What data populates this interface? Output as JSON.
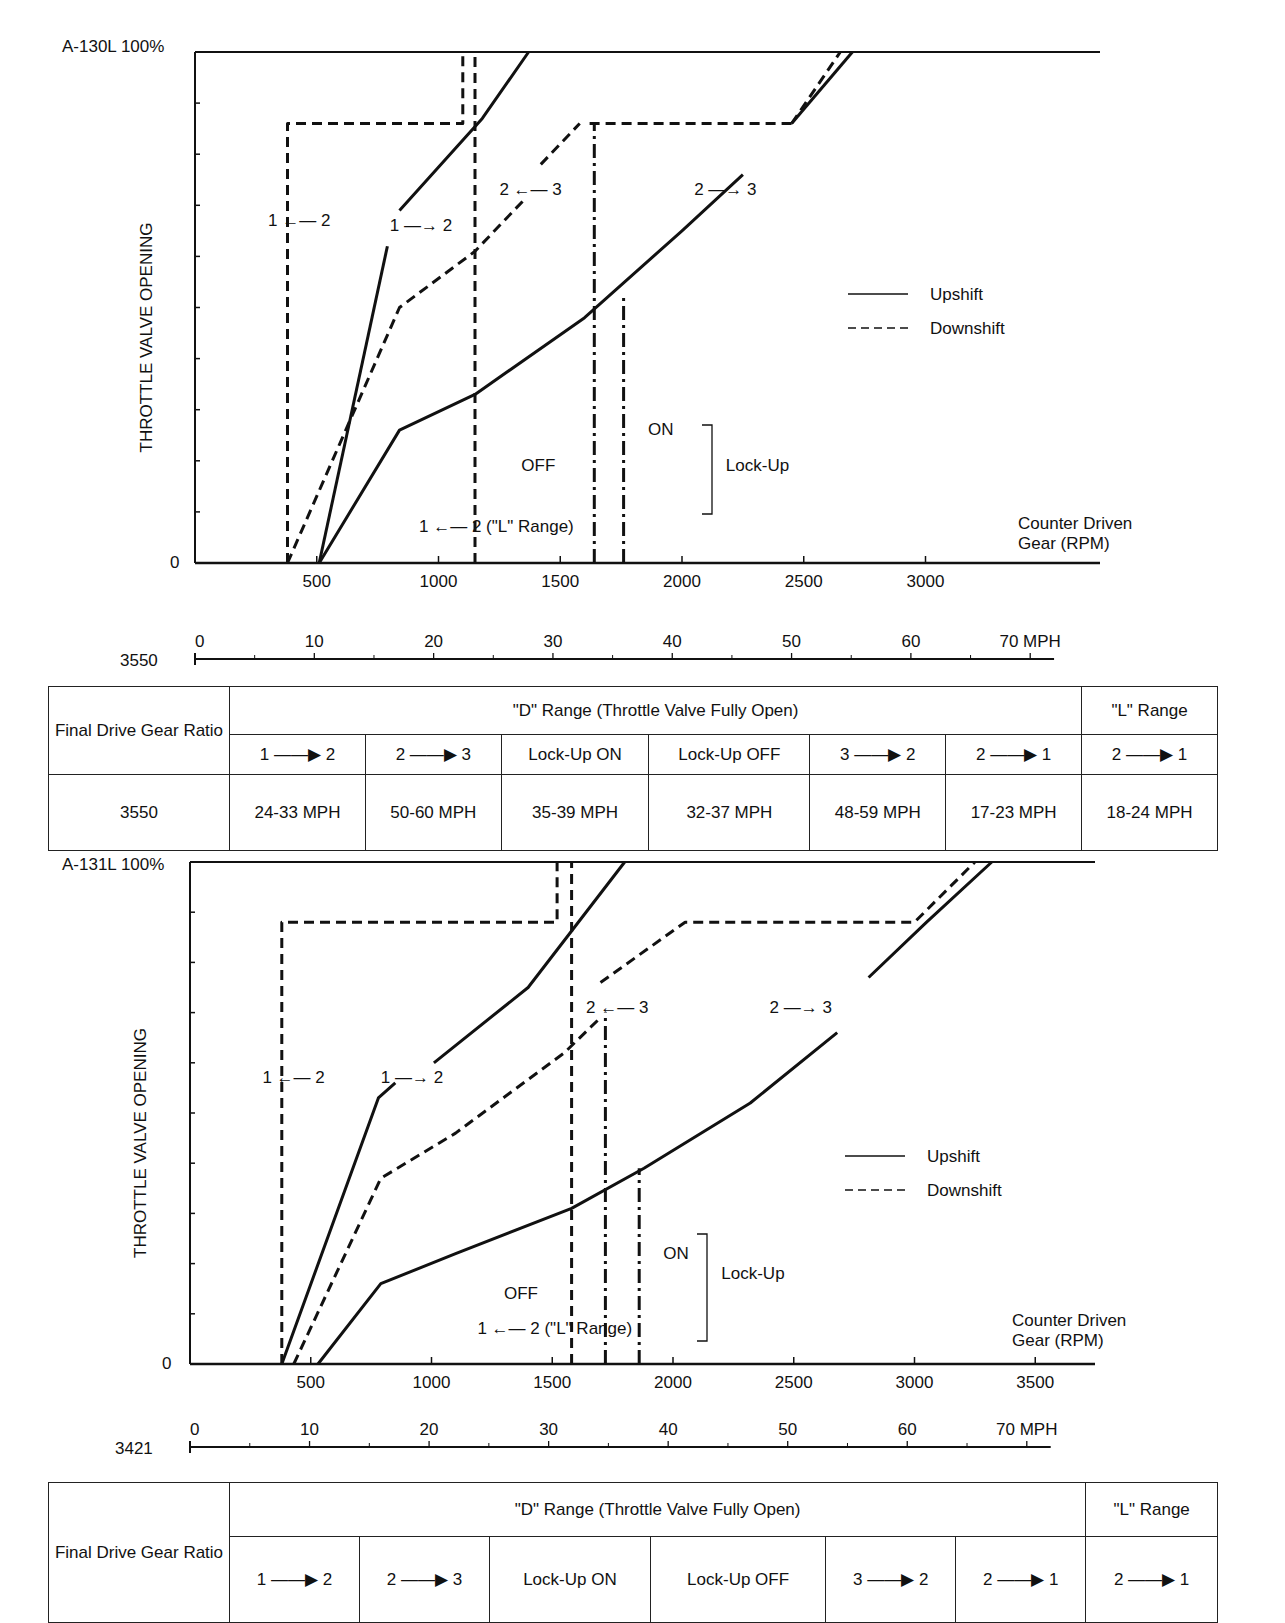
{
  "chart_data": [
    {
      "type": "line",
      "id": "a130l",
      "title": "A-130L 100%",
      "top_label": "A-130L 100%",
      "ylabel": "THROTTLE VALVE OPENING",
      "xlabel": [
        "Counter Driven",
        "Gear (RPM)"
      ],
      "y_zero_label": "0",
      "xlim": [
        0,
        3700
      ],
      "ylim": [
        0,
        100
      ],
      "x_ticks": [
        500,
        1000,
        1500,
        2000,
        2500,
        3000
      ],
      "x_tick_labels": [
        "500",
        "1000",
        "1500",
        "2000",
        "2500",
        "3000"
      ],
      "y_ticks": [
        10,
        20,
        30,
        40,
        50,
        60,
        70,
        80,
        90
      ],
      "legend": {
        "position": "right",
        "entries": [
          {
            "label": "Upshift",
            "style": "solid"
          },
          {
            "label": "Downshift",
            "style": "dashed"
          }
        ]
      },
      "series": [
        {
          "name": "1→2 upshift",
          "style": "solid",
          "points": [
            [
              510,
              0
            ],
            [
              790,
              62
            ]
          ]
        },
        {
          "name": "1→2 upshift (upper)",
          "style": "solid",
          "points": [
            [
              840,
              69
            ],
            [
              1180,
              87
            ],
            [
              1370,
              100
            ]
          ]
        },
        {
          "name": "1→2 downshift",
          "style": "dashed",
          "points": [
            [
              380,
              0
            ],
            [
              840,
              50
            ],
            [
              1150,
              61
            ],
            [
              1350,
              71
            ]
          ]
        },
        {
          "name": "1→2 downshift (upper)",
          "style": "dashed",
          "points": [
            [
              1420,
              78
            ],
            [
              1580,
              86
            ]
          ]
        },
        {
          "name": "1←2 downshift boundary",
          "style": "dashed",
          "points": [
            [
              380,
              0
            ],
            [
              380,
              86
            ],
            [
              1100,
              86
            ],
            [
              1100,
              100
            ]
          ]
        },
        {
          "name": "1←2 L range",
          "style": "dashed",
          "points": [
            [
              1150,
              0
            ],
            [
              1150,
              100
            ]
          ]
        },
        {
          "name": "2→3 upshift",
          "style": "solid",
          "points": [
            [
              510,
              0
            ],
            [
              840,
              26
            ],
            [
              1150,
              33
            ],
            [
              1600,
              48
            ],
            [
              2000,
              65
            ],
            [
              2250,
              76
            ]
          ]
        },
        {
          "name": "2→3 upshift (upper)",
          "style": "solid",
          "points": [
            [
              2450,
              86
            ],
            [
              2700,
              100
            ]
          ]
        },
        {
          "name": "2←3 downshift",
          "style": "dashed",
          "points": [
            [
              2450,
              86
            ],
            [
              1600,
              86
            ]
          ]
        },
        {
          "name": "2←3 downshift (upper)",
          "style": "dashed",
          "points": [
            [
              2450,
              86
            ],
            [
              2650,
              100
            ]
          ]
        },
        {
          "name": "Lock-up OFF",
          "style": "dashdot",
          "points": [
            [
              1640,
              0
            ],
            [
              1640,
              86
            ]
          ]
        },
        {
          "name": "Lock-up ON",
          "style": "dashdot",
          "points": [
            [
              1760,
              0
            ],
            [
              1760,
              52
            ]
          ]
        }
      ],
      "annotations": [
        {
          "text": "1 ←— 2",
          "rpm": 300,
          "pct": 66
        },
        {
          "text": "1 —→ 2",
          "rpm": 800,
          "pct": 65
        },
        {
          "text": "2 ←— 3",
          "rpm": 1250,
          "pct": 72
        },
        {
          "text": "2 —→ 3",
          "rpm": 2050,
          "pct": 72
        },
        {
          "text": "ON",
          "rpm": 1860,
          "pct": 25
        },
        {
          "text": "OFF",
          "rpm": 1340,
          "pct": 18
        },
        {
          "text": "Lock-Up",
          "rpm": 2180,
          "pct": 18
        },
        {
          "text": "1 ←— 2 (\"L\" Range)",
          "rpm": 920,
          "pct": 6
        }
      ],
      "mph_scale": {
        "ratio_label": "3550",
        "ticks": [
          0,
          10,
          20,
          30,
          40,
          50,
          60,
          70
        ],
        "tick_labels": [
          "0",
          "10",
          "20",
          "30",
          "40",
          "50",
          "60",
          "70 MPH"
        ],
        "rpm_per_mph": 49.0
      }
    },
    {
      "type": "line",
      "id": "a131l",
      "title": "A-131L 100%",
      "top_label": "A-131L 100%",
      "ylabel": "THROTTLE VALVE OPENING",
      "xlabel": [
        "Counter Driven",
        "Gear (RPM)"
      ],
      "y_zero_label": "0",
      "xlim": [
        0,
        3800
      ],
      "ylim": [
        0,
        100
      ],
      "x_ticks": [
        500,
        1000,
        1500,
        2000,
        2500,
        3000,
        3500
      ],
      "x_tick_labels": [
        "500",
        "1000",
        "1500",
        "2000",
        "2500",
        "3000",
        "3500"
      ],
      "y_ticks": [
        10,
        20,
        30,
        40,
        50,
        60,
        70,
        80,
        90
      ],
      "legend": {
        "position": "right",
        "entries": [
          {
            "label": "Upshift",
            "style": "solid"
          },
          {
            "label": "Downshift",
            "style": "dashed"
          }
        ]
      },
      "series": [
        {
          "name": "1→2 upshift",
          "style": "solid",
          "points": [
            [
              380,
              0
            ],
            [
              780,
              53
            ],
            [
              850,
              56
            ]
          ]
        },
        {
          "name": "1→2 upshift (upper)",
          "style": "solid",
          "points": [
            [
              1010,
              60
            ],
            [
              1400,
              75
            ],
            [
              1800,
              100
            ]
          ]
        },
        {
          "name": "1→2 downshift",
          "style": "dashed",
          "points": [
            [
              430,
              0
            ],
            [
              790,
              37
            ],
            [
              1100,
              46
            ],
            [
              1550,
              62
            ],
            [
              1700,
              69
            ]
          ]
        },
        {
          "name": "2←3 downshift (upper)",
          "style": "dashed",
          "points": [
            [
              1700,
              76
            ],
            [
              2050,
              88
            ],
            [
              3000,
              88
            ],
            [
              3250,
              100
            ]
          ]
        },
        {
          "name": "1←2 downshift boundary",
          "style": "dashed",
          "points": [
            [
              380,
              0
            ],
            [
              380,
              88
            ],
            [
              1520,
              88
            ],
            [
              1520,
              100
            ]
          ]
        },
        {
          "name": "1←2 L range",
          "style": "dashed",
          "points": [
            [
              1580,
              0
            ],
            [
              1580,
              100
            ]
          ]
        },
        {
          "name": "2→3 upshift",
          "style": "solid",
          "points": [
            [
              530,
              0
            ],
            [
              790,
              16
            ],
            [
              1100,
              22
            ],
            [
              1580,
              31
            ],
            [
              1880,
              39
            ],
            [
              2320,
              52
            ],
            [
              2680,
              66
            ]
          ]
        },
        {
          "name": "2→3 upshift (upper)",
          "style": "solid",
          "points": [
            [
              2810,
              77
            ],
            [
              3050,
              88
            ],
            [
              3320,
              100
            ]
          ]
        },
        {
          "name": "Lock-up OFF",
          "style": "dashdot",
          "points": [
            [
              1720,
              0
            ],
            [
              1720,
              70
            ]
          ]
        },
        {
          "name": "Lock-up ON",
          "style": "dashdot",
          "points": [
            [
              1860,
              0
            ],
            [
              1860,
              39
            ]
          ]
        }
      ],
      "annotations": [
        {
          "text": "1 ←— 2",
          "rpm": 300,
          "pct": 56
        },
        {
          "text": "1 —→ 2",
          "rpm": 790,
          "pct": 56
        },
        {
          "text": "2 ←— 3",
          "rpm": 1640,
          "pct": 70
        },
        {
          "text": "2 —→ 3",
          "rpm": 2400,
          "pct": 70
        },
        {
          "text": "ON",
          "rpm": 1960,
          "pct": 21
        },
        {
          "text": "OFF",
          "rpm": 1300,
          "pct": 13
        },
        {
          "text": "Lock-Up",
          "rpm": 2200,
          "pct": 17
        },
        {
          "text": "1 ←— 2 (\"L\" Range)",
          "rpm": 1190,
          "pct": 6
        }
      ],
      "mph_scale": {
        "ratio_label": "3421",
        "ticks": [
          0,
          10,
          20,
          30,
          40,
          50,
          60,
          70
        ],
        "tick_labels": [
          "0",
          "10",
          "20",
          "30",
          "40",
          "50",
          "60",
          "70 MPH"
        ],
        "rpm_per_mph": 49.5
      }
    }
  ],
  "tables": [
    {
      "ratio_header": "Final Drive Gear Ratio",
      "d_range_header": "\"D\" Range (Throttle Valve Fully Open)",
      "l_range_header": "\"L\" Range",
      "columns": [
        "1 ——▶ 2",
        "2 ——▶ 3",
        "Lock-Up ON",
        "Lock-Up OFF",
        "3 ——▶ 2",
        "2 ——▶ 1",
        "2 ——▶ 1"
      ],
      "rows": [
        {
          "ratio": "3550",
          "values": [
            "24-33 MPH",
            "50-60 MPH",
            "35-39 MPH",
            "32-37 MPH",
            "48-59 MPH",
            "17-23 MPH",
            "18-24 MPH"
          ]
        }
      ]
    },
    {
      "ratio_header": "Final Drive Gear Ratio",
      "d_range_header": "\"D\" Range (Throttle Valve Fully Open)",
      "l_range_header": "\"L\" Range",
      "columns": [
        "1 ——▶ 2",
        "2 ——▶ 3",
        "Lock-Up ON",
        "Lock-Up OFF",
        "3 ——▶ 2",
        "2 ——▶ 1",
        "2 ——▶ 1"
      ],
      "rows": []
    }
  ]
}
